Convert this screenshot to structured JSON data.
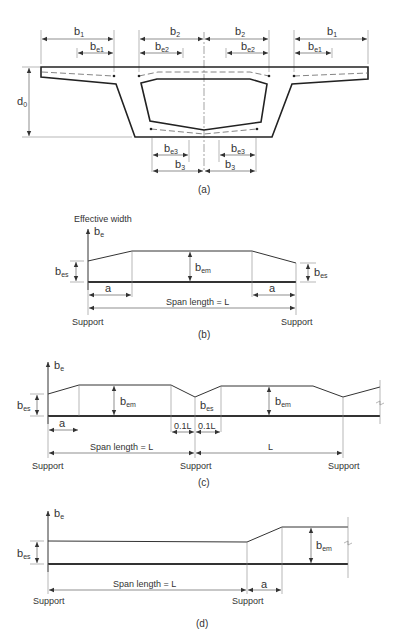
{
  "figure_a": {
    "caption": "(a)",
    "labels": {
      "b1_left": "b",
      "b1_left_sub": "1",
      "be1_left": "b",
      "be1_left_sub": "e1",
      "b2_left": "b",
      "b2_left_sub": "2",
      "be2_left": "b",
      "be2_left_sub": "e2",
      "b2_right": "b",
      "b2_right_sub": "2",
      "be2_right": "b",
      "be2_right_sub": "e2",
      "b1_right": "b",
      "b1_right_sub": "1",
      "be1_right": "b",
      "be1_right_sub": "e1",
      "d0": "d",
      "d0_sub": "0",
      "be3_left": "b",
      "be3_left_sub": "e3",
      "be3_right": "b",
      "be3_right_sub": "e3",
      "b3_left": "b",
      "b3_left_sub": "3",
      "b3_right": "b",
      "b3_right_sub": "3"
    }
  },
  "figure_b": {
    "caption": "(b)",
    "axis_title": "Effective width",
    "axis_label": "b",
    "axis_label_sub": "e",
    "bes_left": "b",
    "bes_left_sub": "es",
    "bem": "b",
    "bem_sub": "em",
    "bes_right": "b",
    "bes_right_sub": "es",
    "a_left": "a",
    "a_right": "a",
    "span": "Span length = L",
    "support_left": "Support",
    "support_right": "Support"
  },
  "figure_c": {
    "caption": "(c)",
    "axis_label": "b",
    "axis_label_sub": "e",
    "bes_left": "b",
    "bes_left_sub": "es",
    "bem_1": "b",
    "bem_1_sub": "em",
    "bes_mid": "b",
    "bes_mid_sub": "es",
    "bem_2": "b",
    "bem_2_sub": "em",
    "a": "a",
    "tenth_left": "0.1L",
    "tenth_right": "0.1L",
    "span": "Span length = L",
    "span_2": "L",
    "support_1": "Support",
    "support_2": "Support",
    "support_3": "Support"
  },
  "figure_d": {
    "caption": "(d)",
    "axis_label": "b",
    "axis_label_sub": "e",
    "bes": "b",
    "bes_sub": "es",
    "bem": "b",
    "bem_sub": "em",
    "span": "Span length = L",
    "a": "a",
    "support_1": "Support",
    "support_2": "Support"
  }
}
